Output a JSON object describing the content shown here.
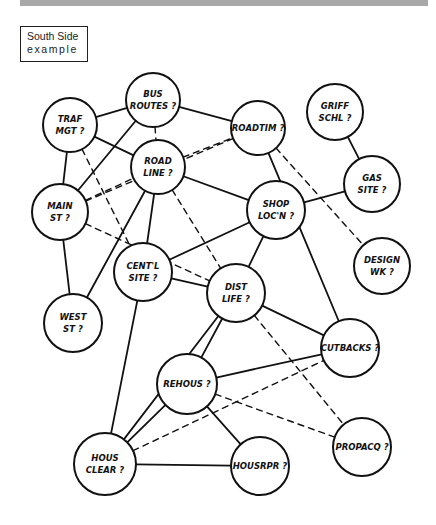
{
  "title": {
    "line1": "South Side",
    "line2": "example"
  },
  "nodes": [
    {
      "id": "bus",
      "line1": "BUS",
      "line2": "ROUTES ?",
      "x": 153,
      "y": 100,
      "r": 27
    },
    {
      "id": "traf",
      "line1": "TRAF",
      "line2": "MGT ?",
      "x": 70,
      "y": 125,
      "r": 27
    },
    {
      "id": "roadtim",
      "line1": "ROADTIM ?",
      "line2": "",
      "x": 258,
      "y": 128,
      "r": 27
    },
    {
      "id": "griff",
      "line1": "GRIFF",
      "line2": "SCHL ?",
      "x": 335,
      "y": 112,
      "r": 28
    },
    {
      "id": "roadline",
      "line1": "ROAD",
      "line2": "LINE ?",
      "x": 158,
      "y": 167,
      "r": 27
    },
    {
      "id": "shop",
      "line1": "SHOP",
      "line2": "LOC'N ?",
      "x": 276,
      "y": 210,
      "r": 29
    },
    {
      "id": "gas",
      "line1": "GAS",
      "line2": "SITE ?",
      "x": 372,
      "y": 184,
      "r": 28
    },
    {
      "id": "main",
      "line1": "MAIN",
      "line2": "ST ?",
      "x": 60,
      "y": 212,
      "r": 28
    },
    {
      "id": "centl",
      "line1": "CENT'L",
      "line2": "SITE ?",
      "x": 143,
      "y": 272,
      "r": 29
    },
    {
      "id": "dist",
      "line1": "DIST",
      "line2": "LIFE ?",
      "x": 236,
      "y": 293,
      "r": 29
    },
    {
      "id": "design",
      "line1": "DESIGN",
      "line2": "WK ?",
      "x": 382,
      "y": 266,
      "r": 28
    },
    {
      "id": "west",
      "line1": "WEST",
      "line2": "ST ?",
      "x": 73,
      "y": 323,
      "r": 29
    },
    {
      "id": "cutbacks",
      "line1": "CUTBACKS ?",
      "line2": "",
      "x": 350,
      "y": 348,
      "r": 29
    },
    {
      "id": "rehous",
      "line1": "REHOUS ?",
      "line2": "",
      "x": 187,
      "y": 384,
      "r": 30
    },
    {
      "id": "housclear",
      "line1": "HOUS",
      "line2": "CLEAR ?",
      "x": 105,
      "y": 464,
      "r": 31
    },
    {
      "id": "housrpr",
      "line1": "HOUSRPR ?",
      "line2": "",
      "x": 260,
      "y": 466,
      "r": 29
    },
    {
      "id": "propacq",
      "line1": "PROPACQ ?",
      "line2": "",
      "x": 362,
      "y": 447,
      "r": 29
    }
  ],
  "edges_solid": [
    [
      "traf",
      "bus"
    ],
    [
      "bus",
      "roadtim"
    ],
    [
      "traf",
      "roadline"
    ],
    [
      "traf",
      "main"
    ],
    [
      "bus",
      "main"
    ],
    [
      "roadline",
      "shop"
    ],
    [
      "roadline",
      "centl"
    ],
    [
      "shop",
      "centl"
    ],
    [
      "shop",
      "dist"
    ],
    [
      "shop",
      "gas"
    ],
    [
      "griff",
      "gas"
    ],
    [
      "roadtim",
      "cutbacks"
    ],
    [
      "centl",
      "dist"
    ],
    [
      "main",
      "west"
    ],
    [
      "dist",
      "cutbacks"
    ],
    [
      "dist",
      "rehous"
    ],
    [
      "rehous",
      "cutbacks"
    ],
    [
      "rehous",
      "housclear"
    ],
    [
      "rehous",
      "housrpr"
    ],
    [
      "housclear",
      "housrpr"
    ],
    [
      "centl",
      "housclear"
    ],
    [
      "dist",
      "housclear"
    ],
    [
      "roadline",
      "west"
    ]
  ],
  "edges_dashed": [
    [
      "bus",
      "roadline"
    ],
    [
      "main",
      "roadtim"
    ],
    [
      "main",
      "roadline"
    ],
    [
      "roadline",
      "roadtim"
    ],
    [
      "traf",
      "centl"
    ],
    [
      "roadtim",
      "design"
    ],
    [
      "roadline",
      "dist"
    ],
    [
      "main",
      "dist"
    ],
    [
      "dist",
      "propacq"
    ],
    [
      "rehous",
      "propacq"
    ],
    [
      "housclear",
      "cutbacks"
    ]
  ]
}
